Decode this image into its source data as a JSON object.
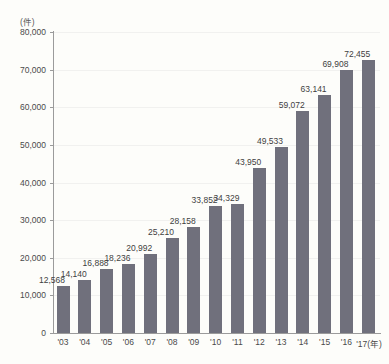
{
  "top_caption": "",
  "axis": {
    "y_unit": "(件)",
    "x_unit": "(年)",
    "y_ticks": [
      "0",
      "10,000",
      "20,000",
      "30,000",
      "40,000",
      "50,000",
      "60,000",
      "70,000",
      "80,000"
    ]
  },
  "colors": {
    "bar": "#70707c",
    "background": "#fdfdfa",
    "axis": "#9b9b9b",
    "grid": "#f1f1ef",
    "text": "#4a4a4a"
  },
  "chart_data": {
    "type": "bar",
    "title": "",
    "subtitle": "",
    "xlabel": "(年)",
    "ylabel": "(件)",
    "ylim": [
      0,
      80000
    ],
    "ytick_step": 10000,
    "grid": true,
    "legend": false,
    "categories": [
      "'03",
      "'04",
      "'05",
      "'06",
      "'07",
      "'08",
      "'09",
      "'10",
      "'11",
      "'12",
      "'13",
      "'14",
      "'15",
      "'16",
      "'17"
    ],
    "values": [
      12568,
      14140,
      16888,
      18236,
      20992,
      25210,
      28158,
      33852,
      34329,
      43950,
      49533,
      59072,
      63141,
      69908,
      72455
    ],
    "value_labels": [
      "12,568",
      "14,140",
      "16,888",
      "18,236",
      "20,992",
      "25,210",
      "28,158",
      "33,852",
      "34,329",
      "43,950",
      "49,533",
      "59,072",
      "63,141",
      "69,908",
      "72,455"
    ],
    "tick_labels": [
      "'03",
      "'04",
      "'05",
      "'06",
      "'07",
      "'08",
      "'09",
      "'10",
      "'11",
      "'12",
      "'13",
      "'14",
      "'15",
      "'16",
      "'17(年)"
    ]
  }
}
